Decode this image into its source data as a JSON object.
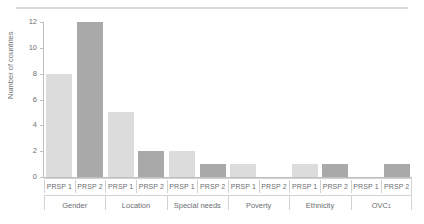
{
  "chart_data": {
    "type": "bar",
    "title": "",
    "subtitle": "",
    "xlabel": "",
    "ylabel": "Number of countries",
    "ylim": [
      0,
      12
    ],
    "yticks": [
      0,
      2,
      4,
      6,
      8,
      10,
      12
    ],
    "ytick_labels": [
      "0",
      "2",
      "4",
      "6",
      "8",
      "10",
      "12"
    ],
    "grid": false,
    "legend": "none",
    "categories": [
      "Gender",
      "Location",
      "Special needs",
      "Poverty",
      "Ethnicity",
      "OVC"
    ],
    "category_labels": [
      {
        "text": "Gender",
        "footnote": ""
      },
      {
        "text": "Location",
        "footnote": ""
      },
      {
        "text": "Special needs",
        "footnote": ""
      },
      {
        "text": "Poverty",
        "footnote": ""
      },
      {
        "text": "Ethnicity",
        "footnote": ""
      },
      {
        "text": "OVC",
        "footnote": "1"
      }
    ],
    "subcategories": [
      "PRSP 1",
      "PRSP 2"
    ],
    "series": [
      {
        "name": "PRSP 1",
        "color": "#dcdcdc",
        "values": [
          8,
          5,
          2,
          1,
          1,
          0
        ]
      },
      {
        "name": "PRSP 2",
        "color": "#a9a9a9",
        "values": [
          12,
          2,
          1,
          0,
          1,
          1
        ]
      }
    ],
    "bars": [
      {
        "group": "Gender",
        "series": "PRSP 1",
        "value": 8
      },
      {
        "group": "Gender",
        "series": "PRSP 2",
        "value": 12
      },
      {
        "group": "Location",
        "series": "PRSP 1",
        "value": 5
      },
      {
        "group": "Location",
        "series": "PRSP 2",
        "value": 2
      },
      {
        "group": "Special needs",
        "series": "PRSP 1",
        "value": 2
      },
      {
        "group": "Special needs",
        "series": "PRSP 2",
        "value": 1
      },
      {
        "group": "Poverty",
        "series": "PRSP 1",
        "value": 1
      },
      {
        "group": "Poverty",
        "series": "PRSP 2",
        "value": 0
      },
      {
        "group": "Ethnicity",
        "series": "PRSP 1",
        "value": 1
      },
      {
        "group": "Ethnicity",
        "series": "PRSP 2",
        "value": 1
      },
      {
        "group": "OVC",
        "series": "PRSP 1",
        "value": 0
      },
      {
        "group": "OVC",
        "series": "PRSP 2",
        "value": 1
      }
    ]
  },
  "colors": {
    "series1": "#dcdcdc",
    "series2": "#a9a9a9",
    "axis": "#bfbfbf",
    "rule": "#d9d9d9",
    "text": "#6d6e71",
    "separator": "#d2d2d2",
    "background": "#ffffff"
  }
}
